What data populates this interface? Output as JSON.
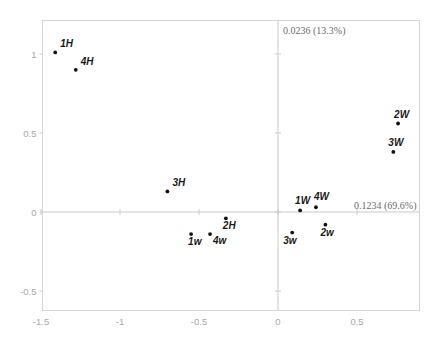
{
  "chart_data": {
    "type": "scatter",
    "title": "",
    "xlabel": "0.1234 (69.6%)",
    "ylabel": "0.0236 (13.3%)",
    "xlim": [
      -1.5,
      0.9
    ],
    "ylim": [
      -0.5,
      1.15
    ],
    "xticks": [
      "-1.5",
      "-1",
      "-0.5",
      "0",
      "0.5"
    ],
    "xtick_values": [
      -1.5,
      -1,
      -0.5,
      0,
      0.5
    ],
    "yticks": [
      "1",
      "0.5",
      "0",
      "-0.5"
    ],
    "ytick_values": [
      1,
      0.5,
      0,
      -0.5
    ],
    "grid": false,
    "legend": "none",
    "axes_through_origin": true,
    "points": [
      {
        "label": "1H",
        "x": -1.41,
        "y": 1.01,
        "label_dx": 5,
        "label_dy": -5
      },
      {
        "label": "4H",
        "x": -1.28,
        "y": 0.9,
        "label_dx": 5,
        "label_dy": -5
      },
      {
        "label": "2W",
        "x": 0.76,
        "y": 0.56,
        "label_dx": -4,
        "label_dy": -6
      },
      {
        "label": "3W",
        "x": 0.73,
        "y": 0.38,
        "label_dx": -5,
        "label_dy": -6
      },
      {
        "label": "3H",
        "x": -0.7,
        "y": 0.13,
        "label_dx": 5,
        "label_dy": -5
      },
      {
        "label": "1W",
        "x": 0.14,
        "y": 0.01,
        "label_dx": -5,
        "label_dy": -6
      },
      {
        "label": "4W",
        "x": 0.24,
        "y": 0.03,
        "label_dx": -2,
        "label_dy": -7
      },
      {
        "label": "2H",
        "x": -0.33,
        "y": -0.04,
        "label_dx": -3,
        "label_dy": 11
      },
      {
        "label": "2w",
        "x": 0.3,
        "y": -0.08,
        "label_dx": -5,
        "label_dy": 11
      },
      {
        "label": "3w",
        "x": 0.09,
        "y": -0.13,
        "label_dx": -9,
        "label_dy": 11
      },
      {
        "label": "1w",
        "x": -0.55,
        "y": -0.14,
        "label_dx": -3,
        "label_dy": 11
      },
      {
        "label": "4w",
        "x": -0.43,
        "y": -0.14,
        "label_dx": 3,
        "label_dy": 10
      }
    ]
  },
  "colors": {
    "marker": "#111111",
    "frame": "#d6d6d6",
    "axis": "#c9c9c9",
    "tick_text": "#a8a8a8",
    "caption_text": "#6b6b6b",
    "background": "#ffffff"
  }
}
